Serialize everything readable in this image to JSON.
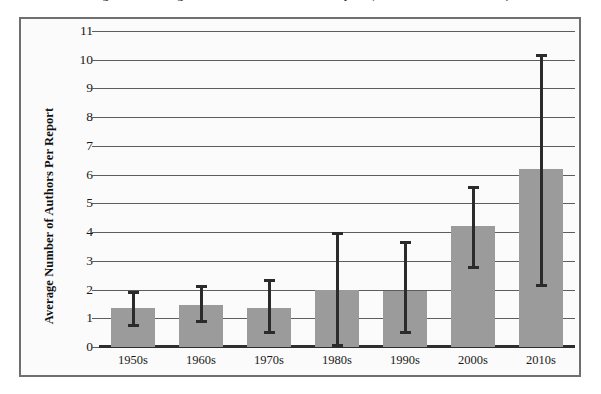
{
  "title": {
    "text": "Figure 1. Average Number of Authors Per Report (with standard deviation)"
  },
  "chart_data": {
    "type": "bar",
    "title": "",
    "xlabel": "",
    "ylabel": "Average Number of Authors Per Report",
    "categories": [
      "1950s",
      "1960s",
      "1970s",
      "1980s",
      "1990s",
      "2000s",
      "2010s"
    ],
    "values": [
      1.35,
      1.45,
      1.35,
      2.0,
      1.95,
      4.2,
      6.2
    ],
    "error_low": [
      0.7,
      0.85,
      0.45,
      0.0,
      0.45,
      2.7,
      2.1
    ],
    "error_high": [
      1.95,
      2.15,
      2.35,
      4.0,
      3.7,
      5.6,
      10.2
    ],
    "ylim": [
      0,
      11
    ],
    "yticks": [
      0,
      1,
      2,
      3,
      4,
      5,
      6,
      7,
      8,
      9,
      10,
      11
    ],
    "ytick_labels": [
      "0",
      "1",
      "2",
      "3",
      "4",
      "5",
      "6",
      "7",
      "8",
      "9",
      "10",
      "11"
    ],
    "grid": true,
    "legend": false,
    "bar_color": "#9b9b9b",
    "error_color": "#2b2b2b",
    "gridline_color": "#5d5d5d",
    "axis_color": "#2e2e2e",
    "frame_color": "#6f6f6f",
    "background": "#fbfbfb"
  }
}
